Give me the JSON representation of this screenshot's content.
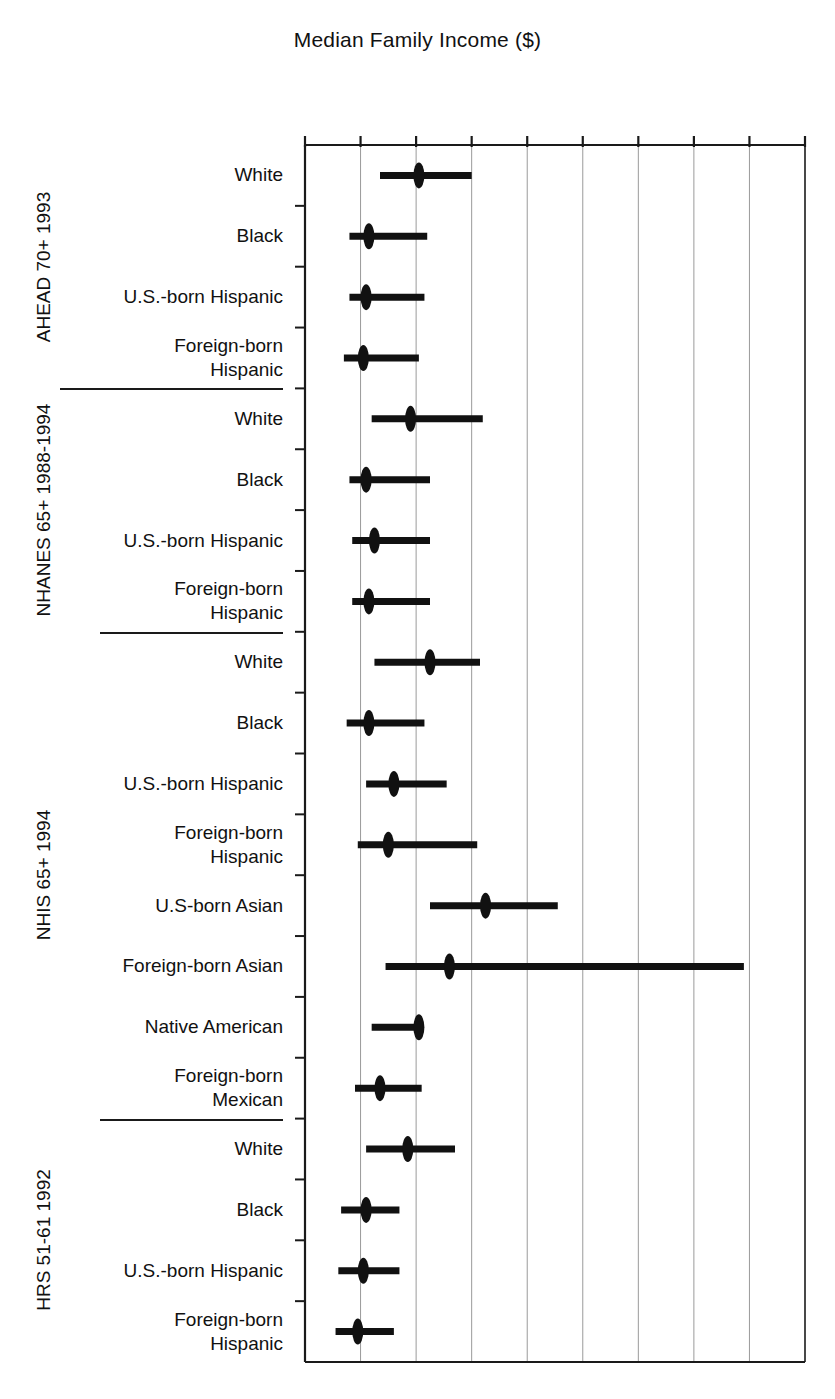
{
  "chart_data": {
    "type": "scatter",
    "title": "Median Family Income ($)",
    "xlabel": "Median Family Income ($)",
    "ylabel": "",
    "xlim": [
      0,
      90000
    ],
    "xticks": [
      0,
      10000,
      20000,
      30000,
      40000,
      50000,
      60000,
      70000,
      80000,
      90000
    ],
    "xtick_labels": [
      "0",
      "10,000",
      "20,000",
      "30,000",
      "40,000",
      "50,000",
      "60,000",
      "70,000",
      "80,000",
      "90,000"
    ],
    "grid": "vertical",
    "legend": "none",
    "orientation": "horizontal-interval",
    "marker": "filled-ellipse",
    "value_key": "median",
    "interval_key": [
      "low",
      "high"
    ],
    "groups": [
      {
        "label": "AHEAD 70+ 1993",
        "rows": [
          {
            "label": "White",
            "median": 20500,
            "low": 13500,
            "high": 30000
          },
          {
            "label": "Black",
            "median": 11500,
            "low": 8000,
            "high": 22000
          },
          {
            "label": "U.S.-born Hispanic",
            "median": 11000,
            "low": 8000,
            "high": 21500
          },
          {
            "label": "Foreign-born\nHispanic",
            "median": 10500,
            "low": 7000,
            "high": 20500
          }
        ]
      },
      {
        "label": "NHANES 65+ 1988-1994",
        "rows": [
          {
            "label": "White",
            "median": 19000,
            "low": 12000,
            "high": 32000
          },
          {
            "label": "Black",
            "median": 11000,
            "low": 8000,
            "high": 22500
          },
          {
            "label": "U.S.-born Hispanic",
            "median": 12500,
            "low": 8500,
            "high": 22500
          },
          {
            "label": "Foreign-born\nHispanic",
            "median": 11500,
            "low": 8500,
            "high": 22500
          }
        ]
      },
      {
        "label": "NHIS 65+ 1994",
        "rows": [
          {
            "label": "White",
            "median": 22500,
            "low": 12500,
            "high": 31500
          },
          {
            "label": "Black",
            "median": 11500,
            "low": 7500,
            "high": 21500
          },
          {
            "label": "U.S.-born Hispanic",
            "median": 16000,
            "low": 11000,
            "high": 25500
          },
          {
            "label": "Foreign-born\nHispanic",
            "median": 15000,
            "low": 9500,
            "high": 31000
          },
          {
            "label": "U.S-born Asian",
            "median": 32500,
            "low": 22500,
            "high": 45500
          },
          {
            "label": "Foreign-born Asian",
            "median": 26000,
            "low": 14500,
            "high": 79000
          },
          {
            "label": "Native American",
            "median": 20500,
            "low": 12000,
            "high": 21000
          },
          {
            "label": "Foreign-born\nMexican",
            "median": 13500,
            "low": 9000,
            "high": 21000
          }
        ]
      },
      {
        "label": "HRS 51-61 1992",
        "rows": [
          {
            "label": "White",
            "median": 18500,
            "low": 11000,
            "high": 27000
          },
          {
            "label": "Black",
            "median": 11000,
            "low": 6500,
            "high": 17000
          },
          {
            "label": "U.S.-born Hispanic",
            "median": 10500,
            "low": 6000,
            "high": 17000
          },
          {
            "label": "Foreign-born\nHispanic",
            "median": 9500,
            "low": 5500,
            "high": 16000
          }
        ]
      }
    ],
    "colors": {
      "ink": "#111111",
      "grid": "#9a9a9a",
      "axis": "#1a1a1a",
      "background": "#ffffff"
    }
  }
}
